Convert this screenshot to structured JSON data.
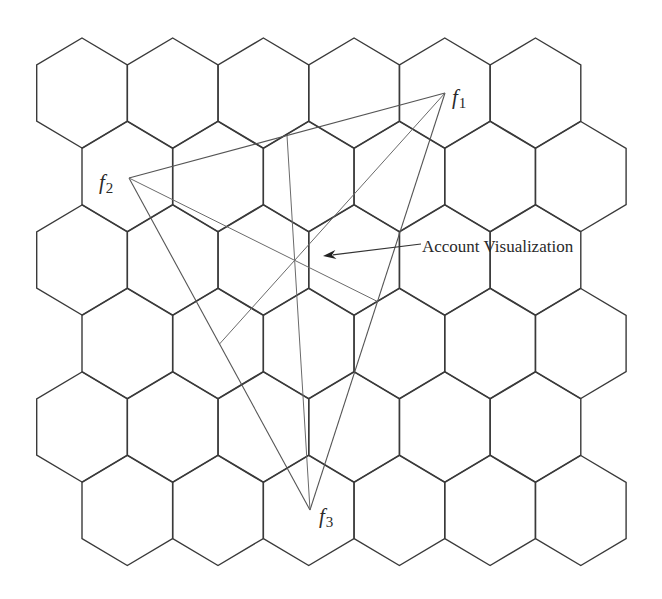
{
  "diagram": {
    "type": "hexagonal-cell-grid-with-triangle",
    "colors": {
      "background": "#ffffff",
      "hex_stroke": "#3a3a3a",
      "triangle_stroke": "#555555",
      "median_stroke": "#6a6a6a",
      "text": "#2a2a2a"
    },
    "grid": {
      "rows": 6,
      "cols": 6,
      "hex_half_width": 45.3,
      "hex_half_side": 28,
      "hex_tip": 27,
      "row_spacing": 83.5,
      "col_spacing": 90.7,
      "first_center": [
        82,
        93
      ],
      "odd_row_offset_x": 45.3
    },
    "points": [
      {
        "id": "f1",
        "label": "f",
        "subscript": "1",
        "x": 445,
        "y": 93,
        "label_x": 452,
        "label_y": 104
      },
      {
        "id": "f2",
        "label": "f",
        "subscript": "2",
        "x": 129,
        "y": 178,
        "label_x": 99,
        "label_y": 189
      },
      {
        "id": "f3",
        "label": "f",
        "subscript": "3",
        "x": 310,
        "y": 510,
        "label_x": 319,
        "label_y": 523
      }
    ],
    "centroid": {
      "x": 294.7,
      "y": 260.3
    },
    "annotation": {
      "text": "Account Visualization",
      "text_x": 422,
      "text_y": 252,
      "arrow_from": [
        421,
        244
      ],
      "arrow_to": [
        323,
        256
      ]
    }
  }
}
